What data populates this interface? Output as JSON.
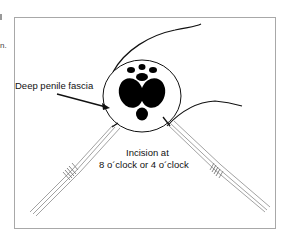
{
  "figure": {
    "stray_text": "n.",
    "labels": {
      "fascia": "Deep penile fascia",
      "incision_line1": "Incision at",
      "incision_line2": "8 o´clock or 4 o´clock"
    },
    "colors": {
      "ink": "#111111",
      "frame": "#a8a8a8",
      "instrument": "#8a8a8a"
    }
  }
}
